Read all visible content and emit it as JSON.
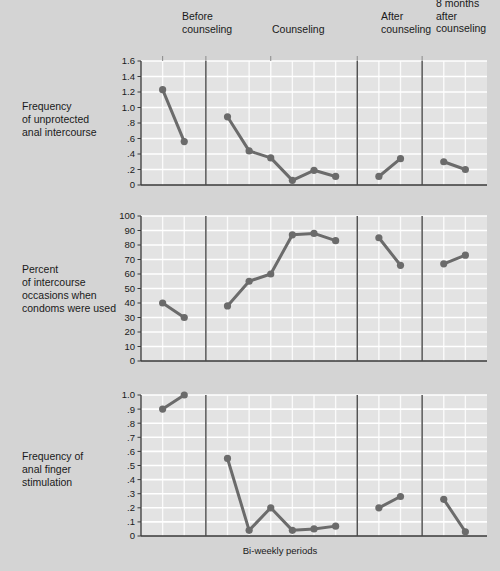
{
  "figure": {
    "background_color": "#d4d4d4",
    "panel_background_color": "#e3e3e3",
    "gridline_color": "#ffffff",
    "series_color": "#6b6b6b",
    "axis_color": "#3a3a3a",
    "xlabel": "Bi-weekly periods",
    "phase_headers": [
      {
        "id": "before",
        "label": "Before\ncounseling"
      },
      {
        "id": "during",
        "label": "Counseling"
      },
      {
        "id": "after",
        "label": "After\ncounseling"
      },
      {
        "id": "months8",
        "label": "8 months\nafter\ncounseling"
      }
    ]
  },
  "chart_data": [
    {
      "type": "line",
      "panel": 1,
      "title": "",
      "ylabel": "Frequency\nof unprotected\nanal intercourse",
      "xlabel": "",
      "ylim": [
        0,
        1.6
      ],
      "yticks": [
        0,
        0.2,
        0.4,
        0.6,
        0.8,
        1.0,
        1.2,
        1.4,
        1.6
      ],
      "ytick_labels": [
        "0",
        ".2",
        ".4",
        ".6",
        ".8",
        "1.0",
        "1.2",
        "1.4",
        "1.6"
      ],
      "grid": true,
      "legend": "none",
      "phases": [
        {
          "name": "Before counseling",
          "x": [
            1,
            2
          ],
          "values": [
            1.23,
            0.56
          ]
        },
        {
          "name": "Counseling",
          "x": [
            4,
            5,
            6,
            7,
            8,
            9
          ],
          "values": [
            0.88,
            0.44,
            0.35,
            0.06,
            0.19,
            0.11
          ]
        },
        {
          "name": "After counseling",
          "x": [
            11,
            12
          ],
          "values": [
            0.11,
            0.34
          ]
        },
        {
          "name": "8 months after counseling",
          "x": [
            14,
            15
          ],
          "values": [
            0.3,
            0.2
          ]
        }
      ]
    },
    {
      "type": "line",
      "panel": 2,
      "title": "",
      "ylabel": "Percent\nof intercourse\noccasions when\ncondoms were used",
      "xlabel": "",
      "ylim": [
        0,
        100
      ],
      "yticks": [
        0,
        10,
        20,
        30,
        40,
        50,
        60,
        70,
        80,
        90,
        100
      ],
      "ytick_labels": [
        "0",
        "10",
        "20",
        "30",
        "40",
        "50",
        "60",
        "70",
        "80",
        "90",
        "100"
      ],
      "grid": true,
      "legend": "none",
      "phases": [
        {
          "name": "Before counseling",
          "x": [
            1,
            2
          ],
          "values": [
            40,
            30
          ]
        },
        {
          "name": "Counseling",
          "x": [
            4,
            5,
            6,
            7,
            8,
            9
          ],
          "values": [
            38,
            55,
            60,
            87,
            88,
            83
          ]
        },
        {
          "name": "After counseling",
          "x": [
            11,
            12
          ],
          "values": [
            85,
            66
          ]
        },
        {
          "name": "8 months after counseling",
          "x": [
            14,
            15
          ],
          "values": [
            67,
            73
          ]
        }
      ]
    },
    {
      "type": "line",
      "panel": 3,
      "title": "",
      "ylabel": "Frequency of\nanal finger\nstimulation",
      "xlabel": "Bi-weekly periods",
      "ylim": [
        0,
        1.0
      ],
      "yticks": [
        0,
        0.1,
        0.2,
        0.3,
        0.4,
        0.5,
        0.6,
        0.7,
        0.8,
        0.9,
        1.0
      ],
      "ytick_labels": [
        "0",
        ".1",
        ".2",
        ".3",
        ".4",
        ".5",
        ".6",
        ".7",
        ".8",
        ".9",
        "1.0"
      ],
      "grid": true,
      "legend": "none",
      "phases": [
        {
          "name": "Before counseling",
          "x": [
            1,
            2
          ],
          "values": [
            0.9,
            1.0
          ]
        },
        {
          "name": "Counseling",
          "x": [
            4,
            5,
            6,
            7,
            8,
            9
          ],
          "values": [
            0.55,
            0.04,
            0.2,
            0.04,
            0.05,
            0.07
          ]
        },
        {
          "name": "After counseling",
          "x": [
            11,
            12
          ],
          "values": [
            0.2,
            0.28
          ]
        },
        {
          "name": "8 months after counseling",
          "x": [
            14,
            15
          ],
          "values": [
            0.26,
            0.03
          ]
        }
      ]
    }
  ]
}
